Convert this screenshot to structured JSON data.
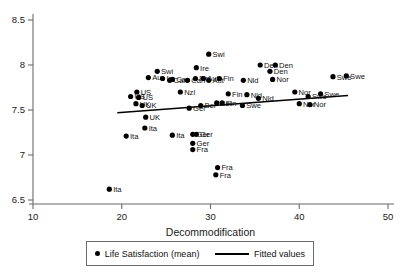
{
  "chart_data": {
    "type": "scatter",
    "title": "",
    "xlabel": "Decommodification",
    "ylabel": "",
    "xlim": [
      10,
      50
    ],
    "ylim": [
      6.5,
      8.5
    ],
    "xticks": [
      10,
      20,
      30,
      40,
      50
    ],
    "yticks": [
      6.5,
      7,
      7.5,
      8,
      8.5
    ],
    "xtick_labels": [
      "10",
      "20",
      "30",
      "40",
      "50"
    ],
    "ytick_labels": [
      "6.5",
      "7",
      "7.5",
      "8",
      "8.5"
    ],
    "grid": false,
    "legend_position": "below-axis",
    "series": [
      {
        "name": "Life Satisfaction (mean)",
        "marker": "filled-circle",
        "color": "#000000",
        "points": [
          {
            "label": "Swi",
            "x": 29.8,
            "y": 8.12
          },
          {
            "label": "Ire",
            "x": 28.4,
            "y": 7.97
          },
          {
            "label": "Aut",
            "x": 29.8,
            "y": 7.83
          },
          {
            "label": "Den",
            "x": 35.6,
            "y": 8.0
          },
          {
            "label": "Den",
            "x": 37.3,
            "y": 8.0
          },
          {
            "label": "Den",
            "x": 36.7,
            "y": 7.93
          },
          {
            "label": "Swi",
            "x": 24.0,
            "y": 7.93
          },
          {
            "label": "Au",
            "x": 23.0,
            "y": 7.86
          },
          {
            "label": "Ire",
            "x": 24.6,
            "y": 7.85
          },
          {
            "label": "Can",
            "x": 25.4,
            "y": 7.83
          },
          {
            "label": "Can",
            "x": 25.7,
            "y": 7.84
          },
          {
            "label": "Can",
            "x": 27.4,
            "y": 7.83
          },
          {
            "label": "Fin",
            "x": 28.3,
            "y": 7.85
          },
          {
            "label": "Aut",
            "x": 29.2,
            "y": 7.85
          },
          {
            "label": "Fin",
            "x": 31.0,
            "y": 7.85
          },
          {
            "label": "Nld",
            "x": 33.7,
            "y": 7.83
          },
          {
            "label": "Nor",
            "x": 37.0,
            "y": 7.84
          },
          {
            "label": "Swe",
            "x": 43.8,
            "y": 7.87
          },
          {
            "label": "Swe",
            "x": 45.3,
            "y": 7.88
          },
          {
            "label": "US",
            "x": 21.7,
            "y": 7.7
          },
          {
            "label": "Nzl",
            "x": 26.6,
            "y": 7.7
          },
          {
            "label": "US",
            "x": 21.0,
            "y": 7.65
          },
          {
            "label": "US",
            "x": 21.9,
            "y": 7.64
          },
          {
            "label": "Fin",
            "x": 32.0,
            "y": 7.68
          },
          {
            "label": "Nld",
            "x": 34.1,
            "y": 7.67
          },
          {
            "label": "Nld",
            "x": 35.4,
            "y": 7.63
          },
          {
            "label": "Nor",
            "x": 39.5,
            "y": 7.7
          },
          {
            "label": "Swe",
            "x": 41.0,
            "y": 7.65
          },
          {
            "label": "Swe",
            "x": 42.4,
            "y": 7.68
          },
          {
            "label": "UK",
            "x": 21.6,
            "y": 7.57
          },
          {
            "label": "UK",
            "x": 22.3,
            "y": 7.55
          },
          {
            "label": "Fin",
            "x": 31.3,
            "y": 7.58
          },
          {
            "label": "Swe",
            "x": 33.6,
            "y": 7.55
          },
          {
            "label": "Nor",
            "x": 40.0,
            "y": 7.57
          },
          {
            "label": "Nor",
            "x": 41.2,
            "y": 7.56
          },
          {
            "label": "Bel",
            "x": 30.7,
            "y": 7.58
          },
          {
            "label": "Bel",
            "x": 28.9,
            "y": 7.55
          },
          {
            "label": "UK",
            "x": 22.7,
            "y": 7.42
          },
          {
            "label": "Ger",
            "x": 27.6,
            "y": 7.52
          },
          {
            "label": "Ita",
            "x": 22.6,
            "y": 7.3
          },
          {
            "label": "Ita",
            "x": 20.5,
            "y": 7.21
          },
          {
            "label": "Ita",
            "x": 25.7,
            "y": 7.22
          },
          {
            "label": "Ger",
            "x": 28.0,
            "y": 7.23
          },
          {
            "label": "Ger",
            "x": 28.4,
            "y": 7.23
          },
          {
            "label": "Ger",
            "x": 28.0,
            "y": 7.13
          },
          {
            "label": "Fra",
            "x": 28.0,
            "y": 7.06
          },
          {
            "label": "Fra",
            "x": 30.8,
            "y": 6.86
          },
          {
            "label": "Fra",
            "x": 30.6,
            "y": 6.78
          },
          {
            "label": "Ita",
            "x": 18.6,
            "y": 6.62
          }
        ]
      }
    ],
    "fit": {
      "name": "Fitted values",
      "color": "#000000",
      "x_start": 19.5,
      "x_end": 45.5,
      "y_start": 7.47,
      "y_end": 7.66
    }
  },
  "legend": {
    "entries": [
      {
        "label": "Life Satisfaction (mean)",
        "marker": "dot"
      },
      {
        "label": "Fitted values",
        "marker": "line"
      }
    ]
  },
  "axes": {
    "x_title": "Decommodification"
  }
}
